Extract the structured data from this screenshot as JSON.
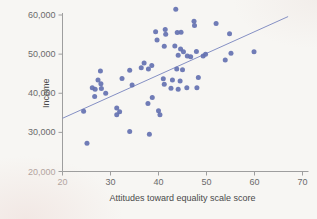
{
  "chart_data": {
    "type": "scatter",
    "title": "",
    "xlabel": "Attitudes toward equality scale score",
    "ylabel": "Income",
    "xlim": [
      20,
      70
    ],
    "ylim": [
      20000,
      60000
    ],
    "x_ticks": [
      20,
      30,
      40,
      50,
      60,
      70
    ],
    "x_tick_labels": [
      "20",
      "30",
      "40",
      "50",
      "60",
      "70"
    ],
    "y_ticks": [
      20000,
      30000,
      40000,
      50000,
      60000
    ],
    "y_tick_labels": [
      "20,000",
      "30,000",
      "40,000",
      "50,000",
      "60,000"
    ],
    "grid": false,
    "legend_position": "none",
    "points": [
      [
        24.4,
        35400
      ],
      [
        25.1,
        27200
      ],
      [
        26.2,
        41400
      ],
      [
        26.7,
        39200
      ],
      [
        26.8,
        41000
      ],
      [
        27.4,
        43400
      ],
      [
        27.9,
        45700
      ],
      [
        28.0,
        42400
      ],
      [
        28.1,
        41200
      ],
      [
        29.0,
        40000
      ],
      [
        31.3,
        36200
      ],
      [
        31.3,
        34500
      ],
      [
        31.9,
        35300
      ],
      [
        32.4,
        43800
      ],
      [
        34.0,
        45900
      ],
      [
        34.0,
        30200
      ],
      [
        34.5,
        42100
      ],
      [
        36.4,
        46500
      ],
      [
        37.0,
        47700
      ],
      [
        37.9,
        46200
      ],
      [
        38.6,
        47100
      ],
      [
        37.8,
        37400
      ],
      [
        38.7,
        38900
      ],
      [
        38.1,
        29500
      ],
      [
        40.0,
        35500
      ],
      [
        40.3,
        34500
      ],
      [
        39.4,
        55700
      ],
      [
        39.7,
        53600
      ],
      [
        41.4,
        56300
      ],
      [
        41.5,
        55100
      ],
      [
        41.2,
        52000
      ],
      [
        41.0,
        43700
      ],
      [
        41.2,
        42300
      ],
      [
        42.6,
        41300
      ],
      [
        42.9,
        43400
      ],
      [
        43.8,
        46200
      ],
      [
        44.1,
        41000
      ],
      [
        44.5,
        43100
      ],
      [
        45.0,
        46000
      ],
      [
        45.9,
        41400
      ],
      [
        48.0,
        41400
      ],
      [
        48.3,
        44000
      ],
      [
        43.4,
        52100
      ],
      [
        44.6,
        51300
      ],
      [
        45.2,
        50600
      ],
      [
        44.1,
        49700
      ],
      [
        46.0,
        49500
      ],
      [
        46.7,
        49300
      ],
      [
        47.9,
        50700
      ],
      [
        49.3,
        49500
      ],
      [
        49.8,
        50000
      ],
      [
        43.6,
        61500
      ],
      [
        47.4,
        58400
      ],
      [
        47.5,
        57300
      ],
      [
        43.9,
        55500
      ],
      [
        44.7,
        55600
      ],
      [
        52.0,
        57800
      ],
      [
        54.8,
        55200
      ],
      [
        55.1,
        50200
      ],
      [
        53.9,
        48500
      ],
      [
        59.9,
        50600
      ]
    ],
    "trend_line": {
      "x1": 20,
      "y1": 33600,
      "x2": 67,
      "y2": 59600
    },
    "colors": {
      "point": "#6471b1",
      "trend": "#8590c4",
      "axis": "#9e9e9e",
      "tick_label": "#6b6b6b",
      "faded_tick_label": "#b3a49f",
      "axis_title": "#4a4a4a"
    }
  }
}
